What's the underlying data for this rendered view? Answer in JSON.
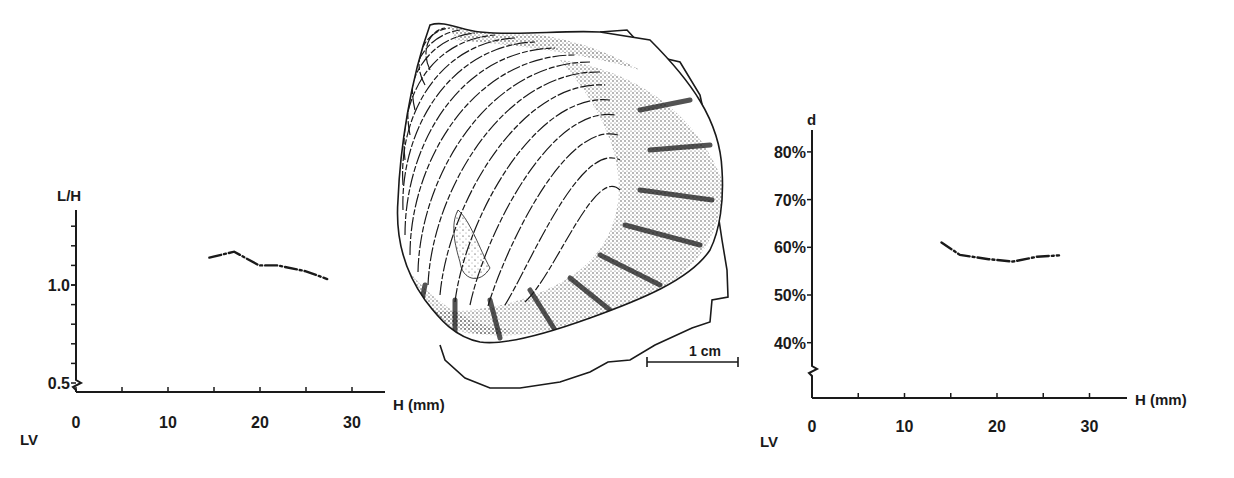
{
  "figure": {
    "scale_bar_label": "1 cm",
    "ink_color": "#1a1a1a",
    "background": "#ffffff"
  },
  "chart_data": [
    {
      "type": "line",
      "id": "left",
      "title": "",
      "ylabel": "L/H",
      "xlabel": "H (mm)",
      "corner_label": "LV",
      "x_ticks": [
        0,
        10,
        20,
        30
      ],
      "x_minor_step": 5,
      "xlim": [
        0,
        34
      ],
      "y_tick_labels": [
        {
          "value": 1.0,
          "label": "1.0"
        },
        {
          "value": 0.5,
          "label": "0.5"
        }
      ],
      "y_minor_step": 0.1,
      "ylim": [
        0.5,
        1.4
      ],
      "axis_break": true,
      "grid": false,
      "line_style": "dash-dot",
      "series": [
        {
          "name": "L/H",
          "x": [
            14.5,
            17.2,
            19.9,
            21.9,
            25.0,
            27.3
          ],
          "y": [
            1.14,
            1.17,
            1.1,
            1.1,
            1.07,
            1.03
          ]
        }
      ]
    },
    {
      "type": "line",
      "id": "right",
      "title": "",
      "ylabel": "d",
      "xlabel": "H (mm)",
      "corner_label": "LV",
      "x_ticks": [
        0,
        10,
        20,
        30
      ],
      "x_minor_step": 5,
      "xlim": [
        0,
        34
      ],
      "y_tick_labels": [
        {
          "value": 80,
          "label": "80%"
        },
        {
          "value": 70,
          "label": "70%"
        },
        {
          "value": 60,
          "label": "60%"
        },
        {
          "value": 50,
          "label": "50%"
        },
        {
          "value": 40,
          "label": "40%"
        }
      ],
      "ylim": [
        40,
        85
      ],
      "axis_break": true,
      "grid": false,
      "line_style": "dash-dot",
      "series": [
        {
          "name": "d",
          "x": [
            14.0,
            16.0,
            19.1,
            21.7,
            24.3,
            26.7
          ],
          "y": [
            61.0,
            58.4,
            57.5,
            57.0,
            58.0,
            58.3
          ]
        }
      ]
    }
  ]
}
